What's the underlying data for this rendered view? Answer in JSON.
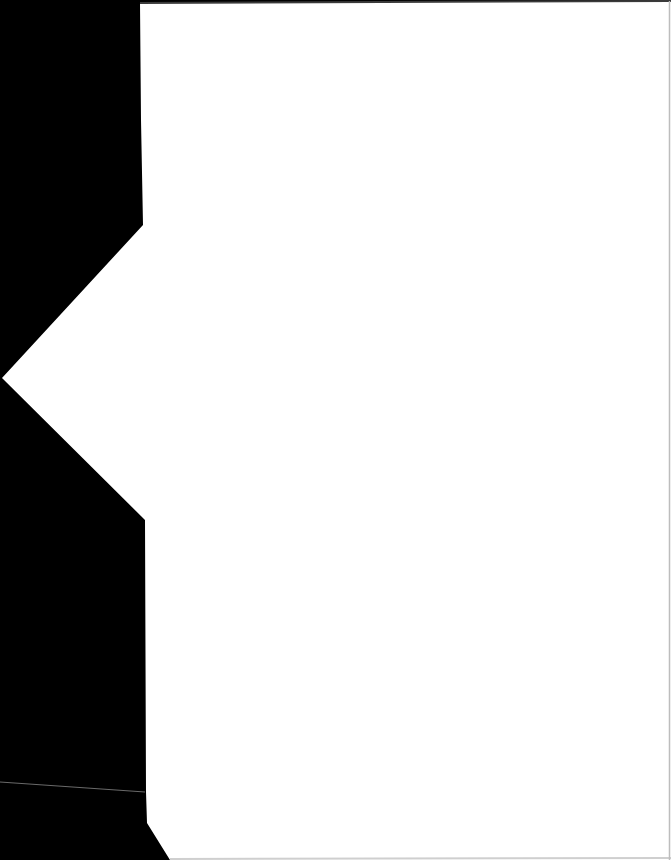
{
  "document": {
    "type": "scanned-page",
    "content_text": "",
    "is_blank": true
  },
  "colors": {
    "scanner_background": "#000000",
    "paper": "#ffffff",
    "page_edge_shadow": "#3a3a3a",
    "right_border": "#bdbdbd",
    "stray_line": "#6a6a6a"
  }
}
